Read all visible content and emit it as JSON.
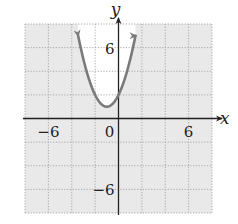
{
  "chart_data": {
    "type": "line",
    "title": "",
    "xlabel": "x",
    "ylabel": "y",
    "xlim": [
      -8,
      8
    ],
    "ylim": [
      -8,
      8
    ],
    "grid": true,
    "grid_step": 2,
    "x_tick_labels": [
      {
        "value": -6,
        "label": "−6"
      },
      {
        "value": 0,
        "label": "0"
      },
      {
        "value": 6,
        "label": "6"
      }
    ],
    "y_tick_labels": [
      {
        "value": 6,
        "label": "6"
      },
      {
        "value": -6,
        "label": "−6"
      }
    ],
    "series": [
      {
        "name": "parabola",
        "equation": "y = x^2 + 2x + 2",
        "vertex": [
          -1,
          1
        ],
        "y_intercept": 2,
        "x_range": [
          -3.45,
          1.45
        ],
        "arrows_at_ends": true,
        "x": [
          -3.45,
          -3,
          -2.5,
          -2,
          -1.5,
          -1,
          -0.5,
          0,
          0.5,
          1,
          1.45
        ],
        "y": [
          8.0,
          5,
          3.25,
          2,
          1.25,
          1,
          1.25,
          2,
          3.25,
          5,
          8.0
        ]
      }
    ],
    "colors": {
      "grid_fill": "#e9e9e9",
      "grid_lines": "#a8a8a8",
      "inside_region": "#ffffff",
      "curve": "#7a7a7a",
      "axes": "#222222"
    }
  }
}
